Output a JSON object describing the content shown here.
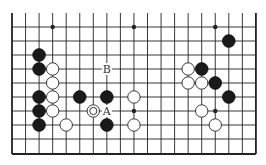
{
  "diagram": {
    "type": "go-board-fragment",
    "board_size": 19,
    "visible_columns": 19,
    "visible_rows": 10,
    "top_edge_open": true,
    "bottom_edge": true,
    "left_edge": true,
    "right_edge": true,
    "colors": {
      "line": "#222222",
      "black_stone": "#1a1a1a",
      "white_stone": "#ffffff",
      "background": "#ffffff"
    },
    "star_points": [
      {
        "col": 3,
        "row": 0
      },
      {
        "col": 9,
        "row": 0
      },
      {
        "col": 15,
        "row": 0
      },
      {
        "col": 3,
        "row": 6
      },
      {
        "col": 9,
        "row": 6
      },
      {
        "col": 15,
        "row": 6
      }
    ],
    "stones": [
      {
        "color": "black",
        "col": 2,
        "row": 2
      },
      {
        "color": "black",
        "col": 2,
        "row": 3
      },
      {
        "color": "black",
        "col": 2,
        "row": 5
      },
      {
        "color": "black",
        "col": 2,
        "row": 6
      },
      {
        "color": "black",
        "col": 2,
        "row": 7
      },
      {
        "color": "white",
        "col": 3,
        "row": 3
      },
      {
        "color": "white",
        "col": 3,
        "row": 4
      },
      {
        "color": "white",
        "col": 3,
        "row": 5
      },
      {
        "color": "white",
        "col": 3,
        "row": 6
      },
      {
        "color": "white",
        "col": 4,
        "row": 7
      },
      {
        "color": "black",
        "col": 5,
        "row": 5
      },
      {
        "color": "white",
        "col": 6,
        "row": 6,
        "marked": true
      },
      {
        "color": "black",
        "col": 7,
        "row": 5
      },
      {
        "color": "black",
        "col": 7,
        "row": 7
      },
      {
        "color": "white",
        "col": 9,
        "row": 5
      },
      {
        "color": "white",
        "col": 9,
        "row": 7
      },
      {
        "color": "white",
        "col": 13,
        "row": 3
      },
      {
        "color": "black",
        "col": 14,
        "row": 3
      },
      {
        "color": "white",
        "col": 13,
        "row": 4
      },
      {
        "color": "white",
        "col": 14,
        "row": 4
      },
      {
        "color": "black",
        "col": 15,
        "row": 4
      },
      {
        "color": "black",
        "col": 16,
        "row": 1
      },
      {
        "color": "black",
        "col": 16,
        "row": 5
      },
      {
        "color": "white",
        "col": 14,
        "row": 6
      },
      {
        "color": "white",
        "col": 15,
        "row": 7
      }
    ],
    "labels": [
      {
        "text": "B",
        "col": 7,
        "row": 3
      },
      {
        "text": "A",
        "col": 7,
        "row": 6
      }
    ]
  }
}
